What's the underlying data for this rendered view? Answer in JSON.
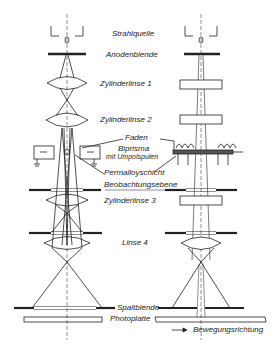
{
  "labels": {
    "strahlquelle": "Strahlquelle",
    "anodenblende": "Anodenblende",
    "zylinderlinse1": "Zylinderlinse 1",
    "zylinderlinse2": "Zylinderlinse 2",
    "faden": "Faden",
    "biprisma": "Biprisma",
    "mit_umpolspulen": "mit Umpolspulen",
    "permalloyschicht": "Permalloyschicht",
    "beobachtungsebene": "Beobachtungsebene",
    "zylinderlinse3": "Zylinderlinse 3",
    "linse4": "Linse 4",
    "spaltblende": "Spaltblende",
    "photoplatte": "Photoplatte",
    "bewegungsrichtung": "Bewegungsrichtung"
  },
  "symbols": {
    "minus": "−",
    "arrow": "→"
  }
}
